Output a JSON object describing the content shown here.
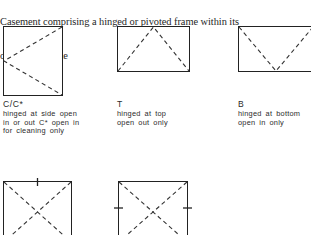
{
  "page": {
    "background_color": "#ffffff",
    "ink_color": "#222222",
    "text_color": "#262626"
  },
  "intro": {
    "line1": "Casement comprising a hinged or pivoted frame within its",
    "line2": "own outer frame"
  },
  "figures": [
    {
      "id": "casement-side-hinged",
      "code": "C/C*",
      "caption_lines": [
        "hinged at side open",
        "in or out  C* open in",
        "for cleaning only"
      ],
      "symbol": "left-pointing-chevron",
      "hinge_edge": "left"
    },
    {
      "id": "casement-top-hinged",
      "code": "T",
      "caption_lines": [
        "hinged at top",
        "open out only"
      ],
      "symbol": "apex-up-triangle",
      "hinge_edge": "top"
    },
    {
      "id": "casement-bottom-hinged",
      "code": "B",
      "caption_lines": [
        "hinged at bottom",
        "open in only"
      ],
      "symbol": "apex-down-vee",
      "hinge_edge": "bottom"
    }
  ],
  "figures_lower": [
    {
      "id": "casement-pivot-horizontal",
      "symbol": "cross-diagonals",
      "pivot_marks": [
        "top-center"
      ]
    },
    {
      "id": "casement-pivot-vertical",
      "symbol": "cross-diagonals",
      "pivot_marks": [
        "left-middle",
        "right-middle"
      ]
    }
  ]
}
